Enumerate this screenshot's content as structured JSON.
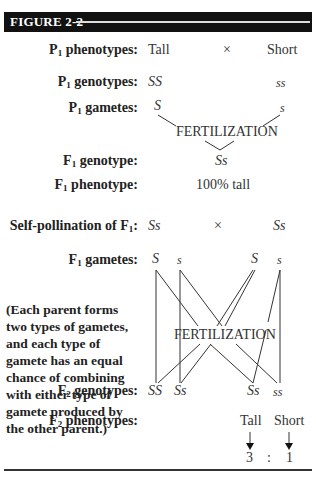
{
  "figure": {
    "title": "FIGURE 2-2"
  },
  "rows": {
    "p1_phenotypes": {
      "label_pre": "P",
      "sub": "1",
      "label_post": " phenotypes:",
      "left": "Tall",
      "cross": "×",
      "right": "Short"
    },
    "p1_genotypes": {
      "label_pre": "P",
      "sub": "1",
      "label_post": " genotypes:",
      "left": "SS",
      "right": "ss"
    },
    "p1_gametes": {
      "label_pre": "P",
      "sub": "1",
      "label_post": " gametes:",
      "left": "S",
      "right": "s"
    },
    "fertilization_1": "FERTILIZATION",
    "f1_genotype": {
      "label_pre": "F",
      "sub": "1",
      "label_post": " genotype:",
      "value": "Ss"
    },
    "f1_phenotype": {
      "label_pre": "F",
      "sub": "1",
      "label_post": " phenotype:",
      "value": "100% tall"
    },
    "self_pollination": {
      "label_pre": "Self-pollination of F",
      "sub": "1",
      "label_post": ":",
      "left": "Ss",
      "cross": "×",
      "right": "Ss"
    },
    "f1_gametes": {
      "label_pre": "F",
      "sub": "1",
      "label_post": " gametes:",
      "values": [
        "S",
        "s",
        "S",
        "s"
      ]
    },
    "fertilization_2": "FERTILIZATION",
    "note": "(Each parent forms two types of gametes, and each type of gamete has an equal chance of combining with either type of gamete produced by the other parent.)",
    "f2_genotypes": {
      "label_pre": "F",
      "sub": "2",
      "label_post": " genotypes:",
      "values": [
        "SS",
        "Ss",
        "Ss",
        "ss"
      ]
    },
    "f2_phenotypes": {
      "label_pre": "F",
      "sub": "2",
      "label_post": " phenotypes:",
      "tall": "Tall",
      "short": "Short"
    },
    "ratio": {
      "tall": "3",
      "sep": ":",
      "short": "1"
    }
  }
}
